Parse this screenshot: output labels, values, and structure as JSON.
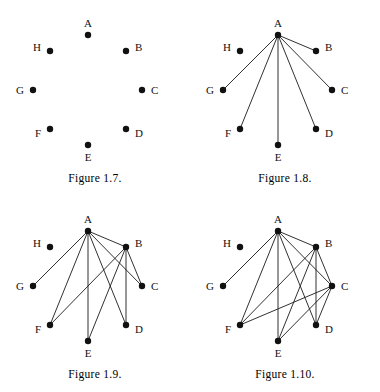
{
  "page": {
    "background_color": "#ffffff",
    "ink_color": "#111111"
  },
  "geometry": {
    "note": "Octagonal layout; coordinates are in each figure's local 190x170 canvas space.",
    "nodes": [
      {
        "id": "A",
        "x": 88,
        "y": 35,
        "label_dx": 0,
        "label_dy": -11,
        "label_anchor": "middle"
      },
      {
        "id": "B",
        "x": 126,
        "y": 51,
        "label_dx": 9,
        "label_dy": -3,
        "label_anchor": "start"
      },
      {
        "id": "C",
        "x": 142,
        "y": 90,
        "label_dx": 9,
        "label_dy": 1,
        "label_anchor": "start"
      },
      {
        "id": "D",
        "x": 126,
        "y": 129,
        "label_dx": 9,
        "label_dy": 5,
        "label_anchor": "start"
      },
      {
        "id": "E",
        "x": 88,
        "y": 145,
        "label_dx": 0,
        "label_dy": 13,
        "label_anchor": "middle"
      },
      {
        "id": "F",
        "x": 50,
        "y": 129,
        "label_dx": -9,
        "label_dy": 5,
        "label_anchor": "end"
      },
      {
        "id": "G",
        "x": 33,
        "y": 90,
        "label_dx": -9,
        "label_dy": 1,
        "label_anchor": "end"
      },
      {
        "id": "H",
        "x": 50,
        "y": 51,
        "label_dx": -9,
        "label_dy": -3,
        "label_anchor": "end"
      }
    ],
    "dot_radius": 3.2
  },
  "figures": [
    {
      "key": "fig-1-7",
      "caption": "Figure 1.7.",
      "position": {
        "left": 0,
        "top": 0
      },
      "vertices": [
        "A",
        "B",
        "C",
        "D",
        "E",
        "F",
        "G",
        "H"
      ],
      "edges": [],
      "edge_count": 0,
      "description": "Eight isolated vertices A through H arranged on a circle."
    },
    {
      "key": "fig-1-8",
      "caption": "Figure 1.8.",
      "position": {
        "left": 190,
        "top": 0
      },
      "vertices": [
        "A",
        "B",
        "C",
        "D",
        "E",
        "F",
        "G",
        "H"
      ],
      "edges": [
        [
          "A",
          "B"
        ],
        [
          "A",
          "C"
        ],
        [
          "A",
          "D"
        ],
        [
          "A",
          "E"
        ],
        [
          "A",
          "F"
        ],
        [
          "A",
          "G"
        ]
      ],
      "edge_count": 6,
      "description": "Vertex A joined to B, C, D, E, F and G. Vertex H remains isolated."
    },
    {
      "key": "fig-1-9",
      "caption": "Figure 1.9.",
      "position": {
        "left": 0,
        "top": 196
      },
      "vertices": [
        "A",
        "B",
        "C",
        "D",
        "E",
        "F",
        "G",
        "H"
      ],
      "edges": [
        [
          "A",
          "B"
        ],
        [
          "A",
          "C"
        ],
        [
          "A",
          "D"
        ],
        [
          "A",
          "E"
        ],
        [
          "A",
          "F"
        ],
        [
          "A",
          "G"
        ],
        [
          "B",
          "C"
        ],
        [
          "B",
          "D"
        ],
        [
          "B",
          "E"
        ],
        [
          "B",
          "F"
        ]
      ],
      "edge_count": 10,
      "description": "Edges of Figure 1.8 together with B joined to C, D, E and F."
    },
    {
      "key": "fig-1-10",
      "caption": "Figure 1.10.",
      "position": {
        "left": 190,
        "top": 196
      },
      "vertices": [
        "A",
        "B",
        "C",
        "D",
        "E",
        "F",
        "G",
        "H"
      ],
      "edges": [
        [
          "A",
          "B"
        ],
        [
          "A",
          "C"
        ],
        [
          "A",
          "D"
        ],
        [
          "A",
          "E"
        ],
        [
          "A",
          "F"
        ],
        [
          "A",
          "G"
        ],
        [
          "B",
          "C"
        ],
        [
          "B",
          "D"
        ],
        [
          "B",
          "E"
        ],
        [
          "B",
          "F"
        ],
        [
          "C",
          "D"
        ],
        [
          "C",
          "E"
        ],
        [
          "C",
          "F"
        ]
      ],
      "edge_count": 13,
      "description": "Edges of Figure 1.9 together with C joined to D, E and F."
    }
  ]
}
